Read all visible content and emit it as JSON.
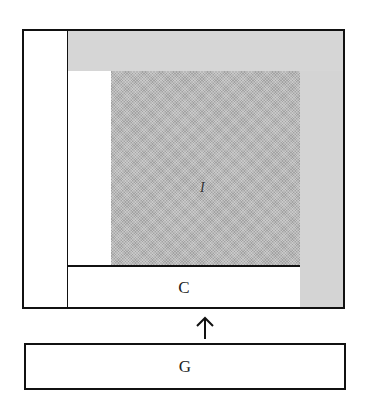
{
  "diagram": {
    "type": "nested-block-diagram",
    "regions": {
      "outer_left_strip": {
        "fill": "#ffffff"
      },
      "top_band": {
        "fill": "#d6d6d6"
      },
      "right_strip": {
        "fill": "#d4d4d4"
      },
      "inner_left_strip": {
        "fill": "#ffffff"
      },
      "center_square": {
        "fill": "#b8b8b8",
        "texture": "stippled",
        "label": "I"
      }
    },
    "boxes": {
      "c_box": {
        "label": "C"
      },
      "g_box": {
        "label": "G"
      }
    },
    "arrow": {
      "from": "G",
      "to": "C",
      "direction": "up",
      "glyph": "↑"
    },
    "colors": {
      "stroke": "#111111",
      "light_gray": "#d6d6d6",
      "texture_gray": "#b8b8b8"
    }
  }
}
